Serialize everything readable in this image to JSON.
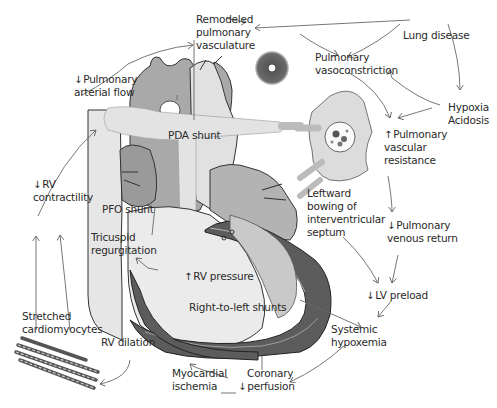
{
  "diagram": {
    "type": "flow-diagram",
    "colors": {
      "light_gray": "#d9d9d9",
      "mid_gray": "#a8a8a8",
      "dark_gray": "#5c5c5c",
      "outline": "#333333",
      "arrow": "#666666"
    },
    "labels": {
      "remodeled_vasculature": [
        "Remodeled",
        "pulmonary",
        "vasculature"
      ],
      "lung_disease": "Lung disease",
      "pulmonary_vasoconstriction": [
        "Pulmonary",
        "vasoconstriction"
      ],
      "hypoxia_acidosis": [
        "Hypoxia",
        "Acidosis"
      ],
      "pulmonary_arterial_flow": {
        "arrow": "↓",
        "lines": [
          "Pulmonary",
          "arterial flow"
        ]
      },
      "pulmonary_vascular_resistance": {
        "arrow": "↑",
        "lines": [
          "Pulmonary",
          "vascular",
          "resistance"
        ]
      },
      "pda_shunt": "PDA shunt",
      "pfo_shunt": "PFO shunt",
      "rv_contractility": {
        "arrow": "↓",
        "lines": [
          "RV",
          "contractility"
        ]
      },
      "tricuspid_regurgitation": [
        "Tricuspid",
        "regurgitation"
      ],
      "leftward_bowing": [
        "Leftward",
        "bowing of",
        "interventricular",
        "septum"
      ],
      "pulmonary_venous_return": {
        "arrow": "↓",
        "lines": [
          "Pulmonary",
          "venous return"
        ]
      },
      "rv_pressure": {
        "arrow": "↑",
        "text": "RV pressure"
      },
      "lv_preload": {
        "arrow": "↓",
        "text": "LV preload"
      },
      "right_to_left_shunts": "Right-to-left shunts",
      "systemic_hypoxemia": [
        "Systemic",
        "hypoxemia"
      ],
      "stretched_cardiomyocytes": [
        "Stretched",
        "cardiomyocytes"
      ],
      "rv_dilation": "RV dilation",
      "myocardial_ischemia": [
        "Myocardial",
        "ischemia"
      ],
      "coronary_perfusion": {
        "arrow": "↓",
        "lines": [
          "Coronary",
          "perfusion"
        ]
      }
    },
    "flows": [
      {
        "from": "Lung disease",
        "to": "Remodeled pulmonary vasculature"
      },
      {
        "from": "Lung disease",
        "to": "Pulmonary vasoconstriction"
      },
      {
        "from": "Lung disease",
        "to": "Hypoxia Acidosis"
      },
      {
        "from": "Hypoxia Acidosis",
        "to": "Pulmonary vasoconstriction"
      },
      {
        "from": "Hypoxia Acidosis",
        "to": "Pulmonary vascular resistance"
      },
      {
        "from": "Remodeled pulmonary vasculature",
        "to": "Pulmonary vasoconstriction"
      },
      {
        "from": "Pulmonary vasoconstriction",
        "to": "Pulmonary vascular resistance"
      },
      {
        "from": "Pulmonary vascular resistance",
        "to": "Pulmonary venous return"
      },
      {
        "from": "Pulmonary venous return",
        "to": "LV preload"
      },
      {
        "from": "Leftward bowing of interventricular septum",
        "to": "LV preload"
      },
      {
        "from": "LV preload",
        "to": "Systemic hypoxemia"
      },
      {
        "from": "Right-to-left shunts",
        "to": "Systemic hypoxemia"
      },
      {
        "from": "Systemic hypoxemia",
        "to": "Coronary perfusion"
      },
      {
        "from": "Coronary perfusion",
        "to": "Myocardial ischemia"
      },
      {
        "from": "Myocardial ischemia",
        "to": "RV dilation"
      },
      {
        "from": "RV dilation",
        "to": "Stretched cardiomyocytes"
      },
      {
        "from": "Stretched cardiomyocytes",
        "to": "RV contractility"
      },
      {
        "from": "RV contractility",
        "to": "Pulmonary arterial flow"
      },
      {
        "from": "Pulmonary arterial flow",
        "to": "Remodeled pulmonary vasculature"
      },
      {
        "from": "RV pressure",
        "to": "Tricuspid regurgitation"
      }
    ]
  }
}
